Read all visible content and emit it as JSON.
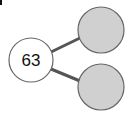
{
  "diagram": {
    "type": "number-bond",
    "whole": {
      "value": "63"
    },
    "parts": [
      {
        "value": ""
      },
      {
        "value": ""
      }
    ],
    "colors": {
      "whole_fill": "#ffffff",
      "part_fill": "#d0d0d0",
      "stroke": "#666666",
      "connector": "#555555"
    }
  }
}
